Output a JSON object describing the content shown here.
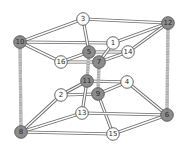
{
  "diagram": {
    "title": "",
    "colors": {
      "edge_outline": "#6a6a6a",
      "edge_fill": "#ffffff",
      "vertical_edge": "#9a9a9a",
      "node_gray": "#8c8c8c",
      "node_white": "#ffffff",
      "node_stroke": "#555555",
      "label_dark": "#2a2a2a"
    },
    "nodes": [
      {
        "id": "1",
        "label": "1",
        "x": 113,
        "y": 43,
        "shade": "white"
      },
      {
        "id": "2",
        "label": "2",
        "x": 61,
        "y": 95,
        "shade": "white"
      },
      {
        "id": "3",
        "label": "3",
        "x": 83,
        "y": 19,
        "shade": "white"
      },
      {
        "id": "4",
        "label": "4",
        "x": 127,
        "y": 82,
        "shade": "white"
      },
      {
        "id": "5",
        "label": "5",
        "x": 89,
        "y": 52,
        "shade": "gray"
      },
      {
        "id": "6",
        "label": "6",
        "x": 167,
        "y": 115,
        "shade": "gray"
      },
      {
        "id": "7",
        "label": "7",
        "x": 99,
        "y": 62,
        "shade": "gray"
      },
      {
        "id": "8",
        "label": "8",
        "x": 21,
        "y": 132,
        "shade": "gray"
      },
      {
        "id": "9",
        "label": "9",
        "x": 98,
        "y": 94,
        "shade": "gray"
      },
      {
        "id": "10",
        "label": "10",
        "x": 20,
        "y": 42,
        "shade": "gray"
      },
      {
        "id": "11",
        "label": "11",
        "x": 87,
        "y": 81,
        "shade": "gray"
      },
      {
        "id": "12",
        "label": "12",
        "x": 168,
        "y": 23,
        "shade": "gray"
      },
      {
        "id": "13",
        "label": "13",
        "x": 82,
        "y": 113,
        "shade": "white"
      },
      {
        "id": "14",
        "label": "14",
        "x": 128,
        "y": 52,
        "shade": "white"
      },
      {
        "id": "15",
        "label": "15",
        "x": 113,
        "y": 134,
        "shade": "white"
      },
      {
        "id": "16",
        "label": "16",
        "x": 61,
        "y": 62,
        "shade": "white"
      }
    ],
    "edges": [
      {
        "from": "10",
        "to": "3",
        "style": "tube"
      },
      {
        "from": "3",
        "to": "12",
        "style": "tube"
      },
      {
        "from": "10",
        "to": "1",
        "style": "tube"
      },
      {
        "from": "1",
        "to": "12",
        "style": "tube"
      },
      {
        "from": "10",
        "to": "16",
        "style": "tube"
      },
      {
        "from": "16",
        "to": "5",
        "style": "tube"
      },
      {
        "from": "16",
        "to": "7",
        "style": "tube"
      },
      {
        "from": "3",
        "to": "5",
        "style": "tube"
      },
      {
        "from": "5",
        "to": "14",
        "style": "tube"
      },
      {
        "from": "7",
        "to": "14",
        "style": "tube"
      },
      {
        "from": "7",
        "to": "1",
        "style": "tube"
      },
      {
        "from": "14",
        "to": "12",
        "style": "tube"
      },
      {
        "from": "11",
        "to": "4",
        "style": "tube"
      },
      {
        "from": "9",
        "to": "4",
        "style": "tube"
      },
      {
        "from": "2",
        "to": "11",
        "style": "tube"
      },
      {
        "from": "2",
        "to": "9",
        "style": "tube"
      },
      {
        "from": "11",
        "to": "13",
        "style": "tube"
      },
      {
        "from": "9",
        "to": "15",
        "style": "tube"
      },
      {
        "from": "4",
        "to": "6",
        "style": "tube"
      },
      {
        "from": "13",
        "to": "6",
        "style": "tube"
      },
      {
        "from": "15",
        "to": "6",
        "style": "tube"
      },
      {
        "from": "8",
        "to": "2",
        "style": "tube"
      },
      {
        "from": "8",
        "to": "13",
        "style": "tube"
      },
      {
        "from": "8",
        "to": "15",
        "style": "tube"
      },
      {
        "from": "10",
        "to": "8",
        "style": "hatched"
      },
      {
        "from": "12",
        "to": "6",
        "style": "hatched"
      },
      {
        "from": "5",
        "to": "11",
        "style": "hatched"
      },
      {
        "from": "7",
        "to": "9",
        "style": "hatched"
      }
    ]
  }
}
